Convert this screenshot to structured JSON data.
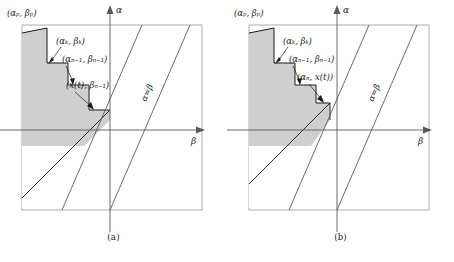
{
  "figure": {
    "panels": [
      {
        "id": "a",
        "caption": "(a)",
        "axis": {
          "vertical": "α",
          "horizontal": "β"
        },
        "diagonal_label": "α=β",
        "labels": {
          "corner": "(αₚ, βₚ)",
          "vertex_k": "(αₖ, βₖ)",
          "vertex_n1": "(αₙ₋₁, βₙ₋₁)",
          "vertex_last": "(x(t), βₙ₋₁)"
        }
      },
      {
        "id": "b",
        "caption": "(b)",
        "axis": {
          "vertical": "α",
          "horizontal": "β"
        },
        "diagonal_label": "α=β",
        "labels": {
          "corner": "(αₚ, βₚ)",
          "vertex_k": "(αₖ, βₖ)",
          "vertex_n1": "(αₙ₋₁, βₙ₋₁)",
          "vertex_last": "(αₙ, x(t))"
        }
      }
    ],
    "colors": {
      "shading": "#cfcfcf",
      "line": "#1a1a1a",
      "axis": "#5a5a5a",
      "border": "#8a8a8a"
    }
  }
}
